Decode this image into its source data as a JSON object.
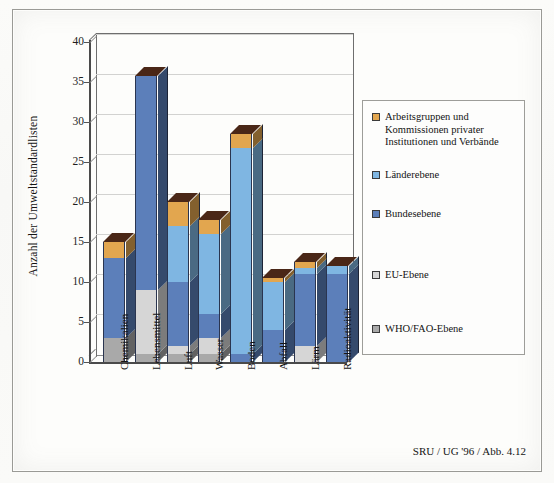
{
  "figure": {
    "footer_credit": "SRU / UG '96 / Abb. 4.12"
  },
  "legend": {
    "position": "right",
    "items": [
      {
        "label": "Arbeitsgruppen und Kommissionen privater Institutionen und Verbände",
        "color": "#E2A64F"
      },
      {
        "label": "Länderebene",
        "color": "#7FB6E2"
      },
      {
        "label": "Bundesebene",
        "color": "#5C7FBA"
      },
      {
        "label": "EU-Ebene",
        "color": "#D6D6D6"
      },
      {
        "label": "WHO/FAO-Ebene",
        "color": "#A9A9A9"
      }
    ]
  },
  "axes": {
    "ylabel": "Anzahl der Umweltstandardlisten",
    "yticks": [
      "0",
      "5",
      "10",
      "15",
      "20",
      "25",
      "30",
      "35",
      "40"
    ],
    "xlabel": ""
  },
  "chart_data": {
    "type": "bar",
    "title": "",
    "subtitle": "",
    "xlabel": "",
    "ylabel": "Anzahl der Umweltstandardlisten",
    "ylim": [
      0,
      40
    ],
    "ytick_step": 5,
    "grid": true,
    "stacked": true,
    "three_d": true,
    "legend_position": "right",
    "categories": [
      "Chemikalien",
      "Lebensmittel",
      "Luft",
      "Wasser",
      "Boden",
      "Abfall",
      "Lärm",
      "Radioaktivität"
    ],
    "series": [
      {
        "name": "WHO/FAO-Ebene",
        "color": "#A9A9A9",
        "values": [
          3,
          1,
          1,
          1,
          0,
          0,
          0,
          0
        ]
      },
      {
        "name": "EU-Ebene",
        "color": "#D6D6D6",
        "values": [
          0,
          8,
          1,
          2,
          0,
          0,
          2,
          0
        ]
      },
      {
        "name": "Bundesebene",
        "color": "#5C7FBA",
        "values": [
          10,
          26.7,
          8,
          3,
          1,
          4,
          9,
          11
        ]
      },
      {
        "name": "Länderebene",
        "color": "#7FB6E2",
        "values": [
          0,
          0,
          7,
          10,
          25.7,
          6,
          0.8,
          1
        ]
      },
      {
        "name": "Arbeitsgruppen und Kommissionen privater Institutionen und Verbände",
        "color": "#E2A64F",
        "values": [
          2,
          0,
          3,
          1.8,
          1.8,
          0.5,
          0.7,
          0
        ]
      }
    ],
    "totals": [
      15,
      35.7,
      20,
      17.8,
      28.5,
      10.5,
      12.5,
      12
    ]
  }
}
